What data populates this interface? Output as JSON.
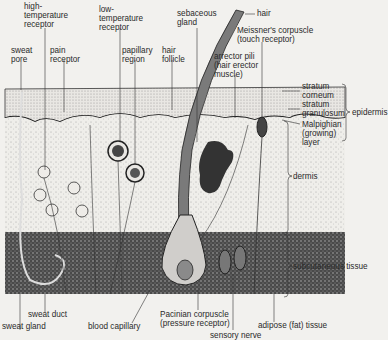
{
  "diagram": {
    "type": "anatomical cross-section of human skin",
    "labels": {
      "high_temperature_receptor": "high-\ntemperature\nreceptor",
      "low_temperature_receptor": "low-\ntemperature\nreceptor",
      "sebaceous_gland": "sebaceous\ngland",
      "hair": "hair",
      "sweat_pore": "sweat\npore",
      "pain_receptor": "pain\nreceptor",
      "papillary_region": "papillary\nregion",
      "hair_follicle": "hair\nfollicle",
      "meissners_corpuscle": "Meissner's corpuscle\n(touch receptor)",
      "arrector_pili": "arrector pili\n(hair erector\nmuscle)",
      "stratum_corneum": "stratum\ncorneum",
      "stratum_granulosum": "stratum\ngranulosum",
      "malpighian_layer": "Malpighian\n(growing)\nlayer",
      "epidermis": "epidermis",
      "dermis": "dermis",
      "subcutaneous_tissue": "subcutaneous tissue",
      "sweat_duct": "sweat duct",
      "sweat_gland": "sweat gland",
      "blood_capillary": "blood capillary",
      "pacinian_corpuscle": "Pacinian corpuscle\n(pressure receptor)",
      "sensory_nerve": "sensory nerve",
      "adipose_tissue": "adipose (fat) tissue"
    },
    "colors": {
      "background": "#f2f1ee",
      "ink": "#2a2a2a",
      "epidermis_fill": "#d8d6d2",
      "dermis_fill": "#e6e4e0",
      "subcutaneous_fill": "#5a5a5a",
      "hair_fill": "#7a7a7a"
    }
  }
}
